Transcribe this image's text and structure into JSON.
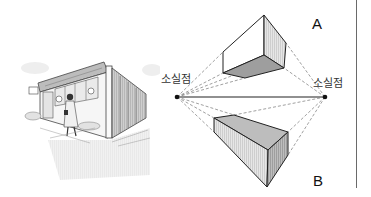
{
  "figure": {
    "left_panel": {
      "description": "Sketch of a corner building with a woman walking in front, drawn in two-point perspective",
      "sign_text": ""
    },
    "diagram": {
      "vanishing_point_left": {
        "label": "소실점",
        "x": 177,
        "y": 97
      },
      "vanishing_point_right": {
        "label": "소실점",
        "x": 325,
        "y": 97
      },
      "box_a": {
        "label": "A"
      },
      "box_b": {
        "label": "B"
      }
    },
    "colors": {
      "line": "#222222",
      "dashed": "#666666",
      "shade_light": "#d4d4d4",
      "shade_dark": "#9a9a9a",
      "divider": "#6a6a6a"
    }
  }
}
